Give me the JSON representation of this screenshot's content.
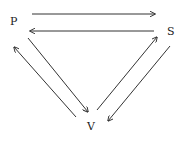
{
  "diagram": {
    "type": "cycle-triangle",
    "nodes": [
      {
        "id": "P",
        "label": "P",
        "x": 14,
        "y": 21
      },
      {
        "id": "S",
        "label": "S",
        "x": 171,
        "y": 31
      },
      {
        "id": "V",
        "label": "V",
        "x": 91,
        "y": 126
      }
    ],
    "edges": [
      {
        "from": "P",
        "to": "S"
      },
      {
        "from": "S",
        "to": "P"
      },
      {
        "from": "P",
        "to": "V"
      },
      {
        "from": "V",
        "to": "P"
      },
      {
        "from": "V",
        "to": "S"
      },
      {
        "from": "S",
        "to": "V"
      }
    ],
    "colors": {
      "line": "#333333",
      "text": "#222222"
    }
  }
}
